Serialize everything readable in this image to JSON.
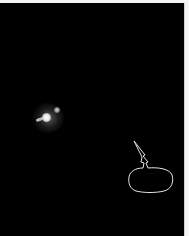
{
  "panel": {
    "background": "#000000",
    "margin_color": "#f4f4f4"
  },
  "orb": {
    "icon": "glowing-orb"
  },
  "speech_bubble": {
    "text": "......"
  }
}
